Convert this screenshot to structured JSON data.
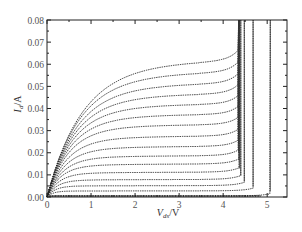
{
  "chart_data": {
    "type": "line",
    "title": "",
    "xlabel": "V_ds/V",
    "ylabel": "I_d/A",
    "xlabel_main": "V",
    "xlabel_sub": "ds",
    "xlabel_unit": "/V",
    "ylabel_main": "I",
    "ylabel_sub": "d",
    "ylabel_unit": "/A",
    "xlim": [
      0,
      5.45
    ],
    "ylim": [
      0,
      0.08
    ],
    "xticks": [
      0,
      1,
      2,
      3,
      4,
      5
    ],
    "xtick_labels": [
      "0",
      "1",
      "2",
      "3",
      "4",
      "5"
    ],
    "yticks": [
      0.0,
      0.01,
      0.02,
      0.03,
      0.04,
      0.05,
      0.06,
      0.07,
      0.08
    ],
    "ytick_labels": [
      "0.00",
      "0.01",
      "0.02",
      "0.03",
      "0.04",
      "0.05",
      "0.06",
      "0.07",
      "0.08"
    ],
    "grid": false,
    "legend": null,
    "line_style": "dotted",
    "color": "#222222",
    "series": [
      {
        "name": "curve 1",
        "saturation_current": 0.0005,
        "knee_voltage": 0.15,
        "breakdown_voltage": 5.07
      },
      {
        "name": "curve 2",
        "saturation_current": 0.0027,
        "knee_voltage": 0.3,
        "breakdown_voltage": 4.68
      },
      {
        "name": "curve 3",
        "saturation_current": 0.005,
        "knee_voltage": 0.4,
        "breakdown_voltage": 4.48
      },
      {
        "name": "curve 4",
        "saturation_current": 0.0077,
        "knee_voltage": 0.5,
        "breakdown_voltage": 4.4
      },
      {
        "name": "curve 5",
        "saturation_current": 0.0109,
        "knee_voltage": 0.6,
        "breakdown_voltage": 4.37
      },
      {
        "name": "curve 6",
        "saturation_current": 0.0145,
        "knee_voltage": 0.7,
        "breakdown_voltage": 4.36
      },
      {
        "name": "curve 7",
        "saturation_current": 0.0181,
        "knee_voltage": 0.8,
        "breakdown_voltage": 4.35
      },
      {
        "name": "curve 8",
        "saturation_current": 0.0222,
        "knee_voltage": 0.9,
        "breakdown_voltage": 4.35
      },
      {
        "name": "curve 9",
        "saturation_current": 0.0267,
        "knee_voltage": 1.0,
        "breakdown_voltage": 4.35
      },
      {
        "name": "curve 10",
        "saturation_current": 0.0317,
        "knee_voltage": 1.1,
        "breakdown_voltage": 4.35
      },
      {
        "name": "curve 11",
        "saturation_current": 0.0362,
        "knee_voltage": 1.2,
        "breakdown_voltage": 4.35
      },
      {
        "name": "curve 12",
        "saturation_current": 0.0407,
        "knee_voltage": 1.3,
        "breakdown_voltage": 4.35
      },
      {
        "name": "curve 13",
        "saturation_current": 0.0452,
        "knee_voltage": 1.4,
        "breakdown_voltage": 4.35
      },
      {
        "name": "curve 14",
        "saturation_current": 0.0498,
        "knee_voltage": 1.5,
        "breakdown_voltage": 4.35
      },
      {
        "name": "curve 15",
        "saturation_current": 0.0547,
        "knee_voltage": 1.6,
        "breakdown_voltage": 4.35
      },
      {
        "name": "curve 16",
        "saturation_current": 0.0597,
        "knee_voltage": 1.75,
        "breakdown_voltage": 4.35
      }
    ]
  }
}
